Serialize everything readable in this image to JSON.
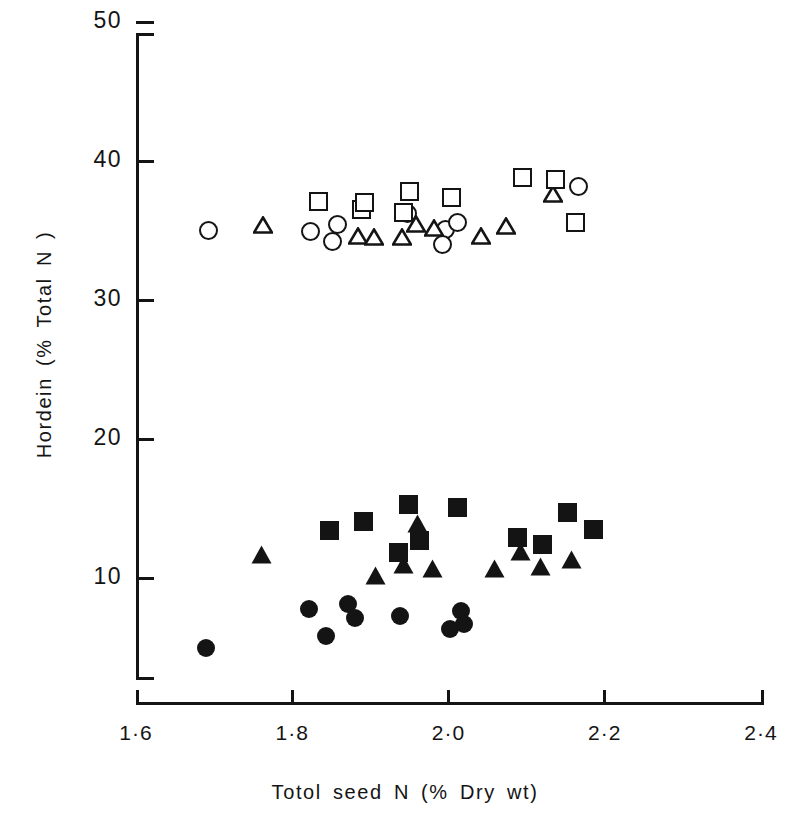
{
  "chart_data": {
    "type": "scatter",
    "title": "",
    "xlabel": "Totol seed N (% Dry wt)",
    "ylabel": "Hordein (% Total N)",
    "xlim": [
      1.6,
      2.4
    ],
    "ylim": [
      0,
      50
    ],
    "xticks": [
      "1·6",
      "1·8",
      "2·0",
      "2·2",
      "2·4"
    ],
    "xtick_values": [
      1.6,
      1.8,
      2.0,
      2.2,
      2.4
    ],
    "yticks": [
      "10",
      "20",
      "30",
      "40",
      "50"
    ],
    "ytick_values": [
      10,
      20,
      30,
      40,
      50
    ],
    "grid": false,
    "legend": "none",
    "marker_color": "#141414",
    "background": "#ffffff",
    "series": [
      {
        "name": "open-circle",
        "marker": "circle-open",
        "points": [
          [
            1.693,
            35.0
          ],
          [
            1.823,
            34.9
          ],
          [
            1.858,
            35.4
          ],
          [
            1.851,
            34.2
          ],
          [
            1.948,
            36.2
          ],
          [
            1.996,
            35.1
          ],
          [
            1.992,
            34.0
          ],
          [
            2.012,
            35.6
          ],
          [
            2.167,
            38.2
          ]
        ]
      },
      {
        "name": "open-triangle",
        "marker": "triangle-open",
        "points": [
          [
            1.763,
            35.4
          ],
          [
            1.884,
            34.6
          ],
          [
            1.905,
            34.5
          ],
          [
            1.94,
            34.5
          ],
          [
            1.958,
            35.5
          ],
          [
            1.981,
            35.2
          ],
          [
            2.042,
            34.6
          ],
          [
            2.073,
            35.3
          ],
          [
            2.134,
            37.6
          ]
        ]
      },
      {
        "name": "open-square",
        "marker": "square-open",
        "points": [
          [
            1.834,
            37.1
          ],
          [
            1.889,
            36.5
          ],
          [
            1.892,
            37.0
          ],
          [
            1.943,
            36.3
          ],
          [
            1.95,
            37.8
          ],
          [
            2.004,
            37.4
          ],
          [
            2.095,
            38.8
          ],
          [
            2.137,
            38.7
          ],
          [
            2.162,
            35.6
          ]
        ]
      },
      {
        "name": "filled-circle",
        "marker": "circle-filled",
        "points": [
          [
            1.689,
            5.0
          ],
          [
            1.822,
            7.8
          ],
          [
            1.843,
            5.8
          ],
          [
            1.871,
            8.1
          ],
          [
            1.88,
            7.1
          ],
          [
            1.938,
            7.3
          ],
          [
            2.002,
            6.3
          ],
          [
            2.016,
            7.6
          ],
          [
            2.02,
            6.7
          ]
        ]
      },
      {
        "name": "filled-triangle",
        "marker": "triangle-filled",
        "points": [
          [
            1.761,
            11.7
          ],
          [
            1.907,
            10.2
          ],
          [
            1.943,
            11.0
          ],
          [
            1.96,
            13.9
          ],
          [
            1.979,
            10.7
          ],
          [
            2.059,
            10.7
          ],
          [
            2.092,
            11.9
          ],
          [
            2.118,
            10.8
          ],
          [
            2.158,
            11.3
          ]
        ]
      },
      {
        "name": "filled-square",
        "marker": "square-filled",
        "points": [
          [
            1.848,
            13.4
          ],
          [
            1.891,
            14.1
          ],
          [
            1.936,
            11.8
          ],
          [
            1.949,
            15.3
          ],
          [
            1.963,
            12.7
          ],
          [
            2.011,
            15.1
          ],
          [
            2.088,
            12.9
          ],
          [
            2.12,
            12.4
          ],
          [
            2.152,
            14.7
          ],
          [
            2.185,
            13.5
          ]
        ]
      }
    ]
  },
  "axes": {
    "y_title": "Hordein (% Total N )",
    "x_title": "Totol seed N (% Dry wt)"
  }
}
